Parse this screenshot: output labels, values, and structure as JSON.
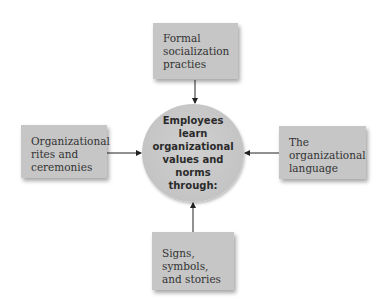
{
  "diagram": {
    "center": {
      "label": "Employees learn organizational values and norms through:"
    },
    "nodes": [
      {
        "id": "top",
        "label": "Formal socialization practies",
        "position": "top"
      },
      {
        "id": "left",
        "label": "Organizational rites and ceremonies",
        "position": "left"
      },
      {
        "id": "right",
        "label": "The organizational language",
        "position": "right"
      },
      {
        "id": "bottom",
        "label": "Signs, symbols, and stories",
        "position": "bottom"
      }
    ],
    "edges": [
      {
        "from": "top",
        "to": "center"
      },
      {
        "from": "left",
        "to": "center"
      },
      {
        "from": "right",
        "to": "center"
      },
      {
        "from": "bottom",
        "to": "center"
      }
    ],
    "colors": {
      "box_fill": "#c6c6c6",
      "circle_fill": "#c8c8c8",
      "arrow": "#222222",
      "text": "#333333"
    }
  }
}
